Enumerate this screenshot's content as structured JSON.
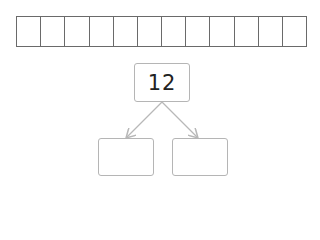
{
  "strip": {
    "cell_count": 12
  },
  "number_bond": {
    "whole": "12",
    "parts": [
      "",
      ""
    ]
  },
  "colors": {
    "strip_border": "#6a6a6a",
    "box_border": "#b5b5b5",
    "arrow": "#b8b8b8"
  }
}
